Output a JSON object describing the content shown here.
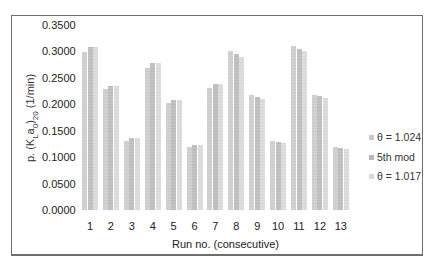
{
  "chart_data": {
    "type": "bar",
    "title": "",
    "xlabel": "Run no. (consecutive)",
    "ylabel": "p. (K_L a_0)_20 (1/min)",
    "ylim": [
      0,
      0.35
    ],
    "yticks": [
      "0.0000",
      "0.0500",
      "0.1000",
      "0.1500",
      "0.2000",
      "0.2500",
      "0.3000",
      "0.3500"
    ],
    "categories": [
      "1",
      "2",
      "3",
      "4",
      "5",
      "6",
      "7",
      "8",
      "9",
      "10",
      "11",
      "12",
      "13"
    ],
    "series": [
      {
        "name": "θ = 1.024",
        "color": "#c8c8c8",
        "values": [
          0.298,
          0.228,
          0.131,
          0.268,
          0.202,
          0.12,
          0.23,
          0.3,
          0.217,
          0.13,
          0.31,
          0.218,
          0.12
        ]
      },
      {
        "name": "5th mod",
        "color": "#b8b8b8",
        "values": [
          0.308,
          0.235,
          0.137,
          0.278,
          0.208,
          0.123,
          0.238,
          0.295,
          0.213,
          0.128,
          0.305,
          0.215,
          0.117
        ]
      },
      {
        "name": "θ = 1.017",
        "color": "#d8d8d8",
        "values": [
          0.308,
          0.235,
          0.136,
          0.278,
          0.208,
          0.123,
          0.238,
          0.29,
          0.21,
          0.126,
          0.3,
          0.212,
          0.115
        ]
      }
    ],
    "grid": false,
    "legend_position": "right"
  },
  "axes": {
    "ylabel_main": "p. (K",
    "ylabel_sub1": "L",
    "ylabel_mid": "a",
    "ylabel_sub2": "0",
    "ylabel_end": ")",
    "ylabel_sub3": "20",
    "ylabel_unit": " (1/min)",
    "xlabel": "Run no. (consecutive)"
  },
  "legend": [
    {
      "label": "θ = 1.024"
    },
    {
      "label": "5th mod"
    },
    {
      "label": "θ = 1.017"
    }
  ]
}
